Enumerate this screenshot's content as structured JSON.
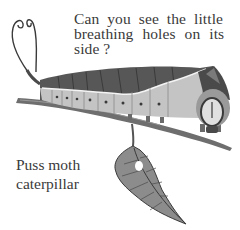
{
  "illustration": {
    "subject": "Puss moth caterpillar on a twig with a hanging leaf",
    "palette": {
      "ink": "#3a3a3a",
      "body_dark": "#5a5a5a",
      "body_mid": "#9a9a9a",
      "body_light": "#c8c8c8",
      "background": "#ffffff"
    }
  },
  "question": {
    "line1": "Can you see the little",
    "line2": "breathing holes on its",
    "line3": "side ?"
  },
  "label": {
    "line1": "Puss moth",
    "line2": "caterpillar"
  }
}
